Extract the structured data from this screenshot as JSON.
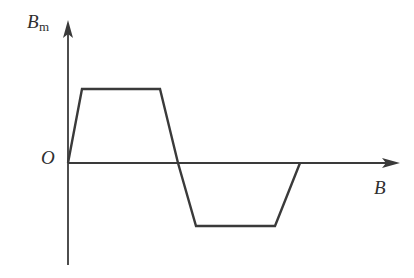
{
  "chart_data": {
    "type": "line",
    "title": "",
    "subtitle": "",
    "xlabel": "B",
    "ylabel": "B",
    "ylabel_subscript": "m",
    "origin_label": "O",
    "grid": false,
    "legend": null,
    "annotations": [],
    "axis_ranges": {
      "x": [
        0,
        9
      ],
      "y": [
        -1.7,
        2.6
      ]
    },
    "xticks": [],
    "yticks": [],
    "series": [
      {
        "name": "Bm waveform",
        "color": "#3a3a3a",
        "x": [
          0.0,
          0.42,
          2.65,
          3.5,
          4.05,
          6.25,
          6.95
        ],
        "values": [
          0.0,
          2.0,
          2.0,
          0.0,
          -1.7,
          -1.7,
          0.0
        ],
        "description": "trapezoidal waveform: rise from origin to positive plateau, fall through zero to negative plateau, rise back to zero"
      }
    ],
    "shape_points_px": [
      [
        68,
        163
      ],
      [
        82,
        89
      ],
      [
        160,
        89
      ],
      [
        178,
        163
      ],
      [
        196,
        226
      ],
      [
        275,
        226
      ],
      [
        300,
        163
      ]
    ],
    "axes_px": {
      "x_axis": [
        68,
        163,
        400,
        163
      ],
      "y_axis": [
        68,
        265,
        68,
        20
      ],
      "x_arrow_tip": [
        400,
        163
      ],
      "y_arrow_tip": [
        68,
        20
      ]
    },
    "colors": {
      "line": "#3a3a3a",
      "axis": "#3a3a3a",
      "background": "#ffffff",
      "label": "#2f2f2f"
    }
  }
}
